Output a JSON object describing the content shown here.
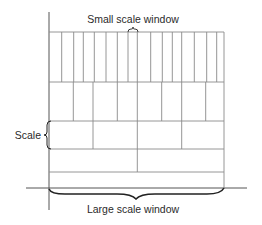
{
  "labels": {
    "top": "Small scale window",
    "left": "Scale",
    "bottom": "Large scale window"
  },
  "colors": {
    "grid": "#8a8a8a",
    "axis": "#555555",
    "brace": "#222222",
    "text": "#2a2a2a"
  },
  "grid": {
    "left": 49,
    "right": 224,
    "rows": [
      {
        "name": "finest",
        "top": 32,
        "bottom": 82,
        "dividers": [
          61.7,
          73.7,
          83.3,
          94.3,
          106,
          117.3,
          128,
          137.3,
          150.7,
          162.3,
          172.3,
          181.7,
          194.3,
          206.7,
          216.7
        ]
      },
      {
        "name": "fine",
        "top": 82,
        "bottom": 121,
        "dividers": [
          73.3,
          93,
          117.3,
          137.3,
          161.7,
          181.7,
          205.7
        ]
      },
      {
        "name": "medium",
        "top": 121,
        "bottom": 149,
        "dividers": [
          93,
          137.3,
          181.7
        ]
      },
      {
        "name": "coarse",
        "top": 149,
        "bottom": 172,
        "dividers": [
          137.3
        ]
      },
      {
        "name": "coarsest",
        "top": 172,
        "bottom": 188,
        "dividers": []
      }
    ]
  },
  "axes": {
    "vertical": {
      "x": 49,
      "y1": 12,
      "y2": 210
    },
    "horizontal": {
      "y": 188,
      "x1": 26,
      "x2": 247
    }
  }
}
